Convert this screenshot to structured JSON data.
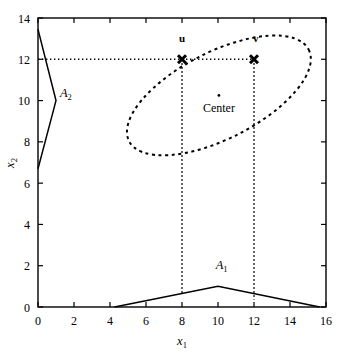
{
  "chart_data": {
    "type": "scatter",
    "title": "",
    "xlabel": "x1",
    "xlabel_base": "x",
    "xlabel_sub": "1",
    "ylabel": "x2",
    "ylabel_base": "x",
    "ylabel_sub": "2",
    "xlim": [
      0,
      16
    ],
    "ylim": [
      0,
      14
    ],
    "xticks": [
      0,
      2,
      4,
      6,
      8,
      10,
      12,
      14,
      16
    ],
    "yticks": [
      0,
      2,
      4,
      6,
      8,
      10,
      12,
      14
    ],
    "xtick_labels": [
      "0",
      "2",
      "4",
      "6",
      "8",
      "10",
      "12",
      "14",
      "16"
    ],
    "ytick_labels": [
      "0",
      "2",
      "4",
      "6",
      "8",
      "10",
      "12",
      "14"
    ],
    "grid": false,
    "legend": "none",
    "frame": "box",
    "annotations": [
      {
        "name": "u-label",
        "text": "u",
        "x": 8.0,
        "y": 12.85,
        "style": "bold"
      },
      {
        "name": "v-label",
        "text": "v",
        "x": 12.1,
        "y": 12.85,
        "style": "bold"
      },
      {
        "name": "center-label",
        "text": "Center",
        "x": 10.05,
        "y": 9.45,
        "style": "normal"
      },
      {
        "name": "region-a1-label",
        "text": "A",
        "sub": "1",
        "x": 10.2,
        "y": 1.85,
        "style": "italic"
      },
      {
        "name": "region-a2-label",
        "text": "A",
        "sub": "2",
        "x": 1.55,
        "y": 10.15,
        "style": "italic"
      }
    ],
    "points": [
      {
        "name": "u",
        "label": "u",
        "x": 8.0,
        "y": 12.0,
        "marker": "x"
      },
      {
        "name": "v",
        "label": "v",
        "x": 12.0,
        "y": 12.0,
        "marker": "x"
      },
      {
        "name": "center",
        "label": "Center",
        "x": 10.05,
        "y": 10.25,
        "marker": "dot"
      }
    ],
    "series": [
      {
        "name": "ellipse",
        "label": "ellipse-contour",
        "style": "dashed",
        "type": "ellipse",
        "cx": 10.05,
        "cy": 10.25,
        "rx": 5.6,
        "ry": 2.1,
        "rotation_deg": -27
      },
      {
        "name": "region-A1",
        "label": "A1",
        "style": "solid",
        "type": "polyline",
        "points": [
          [
            4.25,
            0.0
          ],
          [
            10.0,
            1.0
          ],
          [
            15.65,
            0.0
          ]
        ]
      },
      {
        "name": "region-A2",
        "label": "A2",
        "style": "solid",
        "type": "polyline",
        "points": [
          [
            0.0,
            13.45
          ],
          [
            1.0,
            10.0
          ],
          [
            0.0,
            6.7
          ]
        ]
      },
      {
        "name": "guide-horizontal-y12",
        "label": "y = 12 guide",
        "style": "dotted",
        "type": "polyline",
        "points": [
          [
            0.0,
            12.0
          ],
          [
            12.0,
            12.0
          ]
        ]
      },
      {
        "name": "guide-vertical-x8",
        "label": "x = 8 guide",
        "style": "dotted",
        "type": "polyline",
        "points": [
          [
            8.0,
            12.0
          ],
          [
            8.0,
            0.62
          ]
        ]
      },
      {
        "name": "guide-vertical-x12",
        "label": "x = 12 guide",
        "style": "dotted",
        "type": "polyline",
        "points": [
          [
            12.0,
            12.0
          ],
          [
            12.0,
            0.35
          ]
        ]
      }
    ],
    "colors": {
      "foreground": "#000000",
      "background": "#ffffff"
    }
  }
}
